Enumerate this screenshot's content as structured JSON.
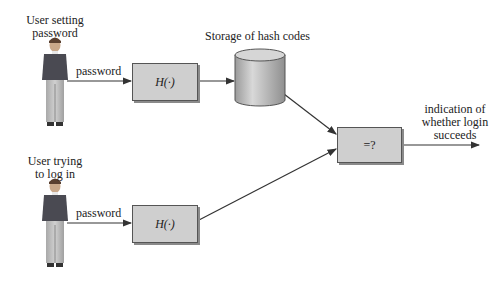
{
  "diagram": {
    "actors": [
      {
        "id": "user-setting",
        "label_lines": [
          "User setting",
          "password"
        ]
      },
      {
        "id": "user-login",
        "label_lines": [
          "User trying",
          "to log in"
        ]
      }
    ],
    "edges": {
      "setting_password_label": "password",
      "login_password_label": "password"
    },
    "hash_box_top": {
      "label": "H(·)"
    },
    "hash_box_bottom": {
      "label": "H(·)"
    },
    "storage": {
      "label": "Storage of hash codes"
    },
    "compare_box": {
      "label": "=?"
    },
    "output": {
      "label_lines": [
        "indication of",
        "whether login",
        "succeeds"
      ]
    },
    "colors": {
      "box_fill": "#cfcfcf",
      "cylinder_fill": "#bdbdbd",
      "line": "#333333"
    }
  }
}
